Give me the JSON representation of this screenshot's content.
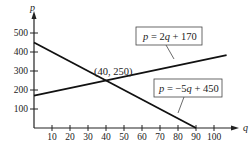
{
  "chart_data": {
    "type": "line",
    "title": "",
    "xlabel": "q",
    "ylabel": "p",
    "xlim": [
      0,
      107
    ],
    "ylim": [
      0,
      530
    ],
    "x_ticks": [
      10,
      20,
      30,
      40,
      50,
      60,
      70,
      80,
      90,
      100
    ],
    "y_ticks": [
      100,
      200,
      300,
      400,
      500
    ],
    "grid": false,
    "legend": "none (inline boxed labels)",
    "series": [
      {
        "name": "p = 2q + 170",
        "equation": {
          "slope": 2,
          "intercept": 170
        },
        "x": [
          0,
          107
        ],
        "values": [
          170,
          384
        ]
      },
      {
        "name": "p = -5q + 450",
        "equation": {
          "slope": -5,
          "intercept": 450
        },
        "x": [
          0,
          90
        ],
        "values": [
          450,
          0
        ]
      }
    ],
    "annotations": [
      {
        "text": "(40, 250)",
        "x": 40,
        "y": 250,
        "type": "intersection"
      },
      {
        "text": "p = 2q + 170",
        "target_series": 0
      },
      {
        "text": "p = −5q + 450",
        "target_series": 1
      }
    ]
  },
  "labels": {
    "x_axis": "q",
    "y_axis": "p",
    "intersection": "(40, 250)",
    "line1": {
      "var": "p",
      "rest": " = 2",
      "q": "q",
      "tail": " + 170"
    },
    "line2": {
      "var": "p",
      "rest": " = −5",
      "q": "q",
      "tail": " + 450"
    }
  }
}
